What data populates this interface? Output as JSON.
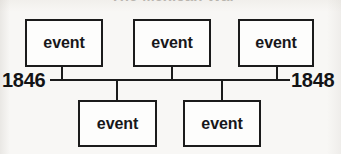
{
  "diagram": {
    "type": "timeline",
    "title_cut_off": "The Mexican War",
    "background_color": "#f8f7f5",
    "line_color": "#1b1b1b",
    "axis": {
      "start_label": "1846",
      "end_label": "1848",
      "y": 80,
      "x_start": 50,
      "x_end": 290
    },
    "events_above": [
      {
        "label": "event",
        "x": 25,
        "y": 19,
        "w": 78,
        "h": 48,
        "stem_x": 62
      },
      {
        "label": "event",
        "x": 133,
        "y": 19,
        "w": 78,
        "h": 48,
        "stem_x": 172
      },
      {
        "label": "event",
        "x": 238,
        "y": 19,
        "w": 76,
        "h": 48,
        "stem_x": 277
      }
    ],
    "events_below": [
      {
        "label": "event",
        "x": 78,
        "y": 100,
        "w": 79,
        "h": 47,
        "stem_x": 117
      },
      {
        "label": "event",
        "x": 183,
        "y": 100,
        "w": 78,
        "h": 47,
        "stem_x": 222
      }
    ]
  }
}
